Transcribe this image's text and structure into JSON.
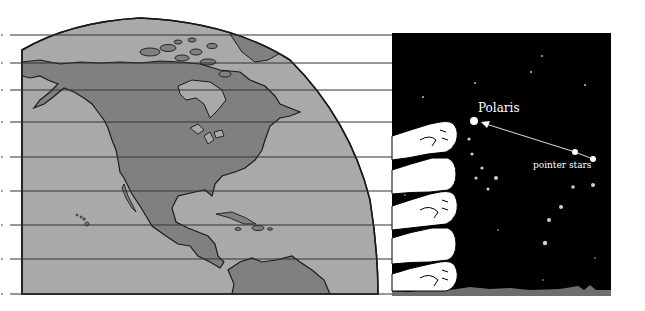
{
  "diagram": {
    "labels": {
      "polaris": "Polaris",
      "pointer_stars": "pointer stars"
    },
    "colors": {
      "ocean": "#a9a9a9",
      "land": "#808080",
      "outline": "#1a1a1a",
      "sky": "#000000",
      "star": "#ffffff",
      "dim_star": "#bdbdbd",
      "fist": "#ffffff",
      "ground": "#6e6e6e",
      "grid_line": "#333333"
    },
    "latitude_lines_y": [
      35,
      63,
      90,
      122,
      157,
      191,
      225,
      259,
      294
    ],
    "fist_count": 5,
    "stars": {
      "polaris": {
        "x": 474,
        "y": 121,
        "r": 4
      },
      "pointers": [
        {
          "x": 575,
          "y": 152,
          "r": 3
        },
        {
          "x": 593,
          "y": 159,
          "r": 3
        }
      ]
    }
  }
}
